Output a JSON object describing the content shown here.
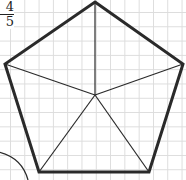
{
  "figure": {
    "type": "regular-pentagon-divided",
    "fraction": {
      "numerator": "4",
      "denominator": "5"
    },
    "grid": true,
    "colors": {
      "line": "#2a2a2a",
      "grid": "#dcdcdc",
      "background": "#ffffff"
    }
  }
}
